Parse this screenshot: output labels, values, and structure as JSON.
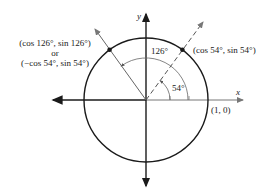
{
  "diagram": {
    "type": "unit-circle",
    "axes": {
      "x_label": "x",
      "y_label": "y"
    },
    "points": {
      "p126": {
        "line1": "(cos 126°, sin 126°)",
        "line2": "or",
        "line3": "(−cos 54°, sin 54°)"
      },
      "p54": {
        "label": "(cos 54°, sin 54°)"
      },
      "p10": {
        "label": "(1, 0)"
      }
    },
    "angles": {
      "a126": "126°",
      "a54": "54°"
    },
    "colors": {
      "stroke": "#1a1a1a",
      "gray": "#777777"
    }
  }
}
